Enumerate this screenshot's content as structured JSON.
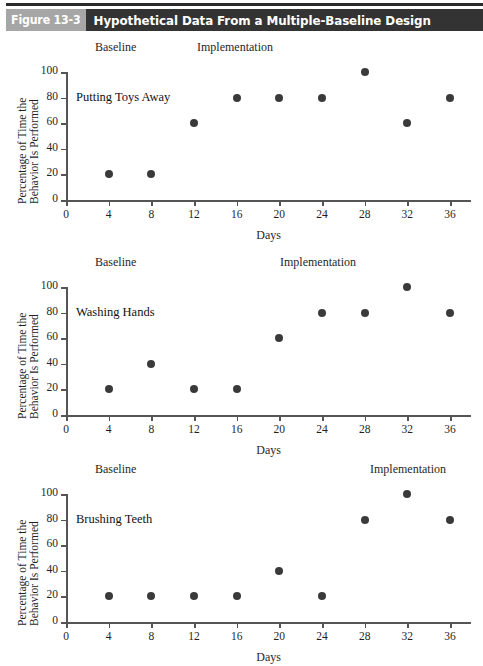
{
  "figure": {
    "number_label": "Figure 13-3",
    "title": "Hypothetical Data From a Multiple-Baseline Design"
  },
  "chart_data": [
    {
      "type": "scatter",
      "title": "Putting Toys Away",
      "xlabel": "Days",
      "ylabel": "Percentage of Time the Behavior Is Performed",
      "ylabel_line1": "Percentage of Time the",
      "ylabel_line2": "Behavior Is Performed",
      "x": [
        4,
        8,
        12,
        16,
        20,
        24,
        28,
        32,
        36
      ],
      "values": [
        20,
        20,
        60,
        80,
        80,
        80,
        100,
        60,
        80
      ],
      "xticks": [
        0,
        4,
        8,
        12,
        16,
        20,
        24,
        28,
        32,
        36
      ],
      "yticks": [
        0,
        20,
        40,
        60,
        80,
        100
      ],
      "xlim": [
        0,
        38
      ],
      "ylim": [
        0,
        100
      ],
      "grid": false,
      "phases": [
        {
          "label": "Baseline",
          "start_day": 0,
          "end_day": 10
        },
        {
          "label": "Implementation",
          "start_day": 10,
          "end_day": 38
        }
      ]
    },
    {
      "type": "scatter",
      "title": "Washing Hands",
      "xlabel": "Days",
      "ylabel": "Percentage of Time the Behavior Is Performed",
      "ylabel_line1": "Percentage of Time the",
      "ylabel_line2": "Behavior Is Performed",
      "x": [
        4,
        8,
        12,
        16,
        20,
        24,
        28,
        32,
        36
      ],
      "values": [
        20,
        40,
        20,
        20,
        60,
        80,
        80,
        100,
        80
      ],
      "xticks": [
        0,
        4,
        8,
        12,
        16,
        20,
        24,
        28,
        32,
        36
      ],
      "yticks": [
        0,
        20,
        40,
        60,
        80,
        100
      ],
      "xlim": [
        0,
        38
      ],
      "ylim": [
        0,
        100
      ],
      "grid": false,
      "phases": [
        {
          "label": "Baseline",
          "start_day": 0,
          "end_day": 18
        },
        {
          "label": "Implementation",
          "start_day": 18,
          "end_day": 38
        }
      ]
    },
    {
      "type": "scatter",
      "title": "Brushing Teeth",
      "xlabel": "Days",
      "ylabel": "Percentage of Time the Behavior Is Performed",
      "ylabel_line1": "Percentage of Time the",
      "ylabel_line2": "Behavior Is Performed",
      "x": [
        4,
        8,
        12,
        16,
        20,
        24,
        28,
        32,
        36
      ],
      "values": [
        20,
        20,
        20,
        20,
        40,
        20,
        80,
        100,
        80
      ],
      "xticks": [
        0,
        4,
        8,
        12,
        16,
        20,
        24,
        28,
        32,
        36
      ],
      "yticks": [
        0,
        20,
        40,
        60,
        80,
        100
      ],
      "xlim": [
        0,
        38
      ],
      "ylim": [
        0,
        100
      ],
      "grid": false,
      "phases": [
        {
          "label": "Baseline",
          "start_day": 0,
          "end_day": 26
        },
        {
          "label": "Implementation",
          "start_day": 26,
          "end_day": 38
        }
      ]
    }
  ],
  "layout": {
    "phase_label_x": [
      {
        "baseline": 95,
        "implementation": 197
      },
      {
        "baseline": 95,
        "implementation": 280
      },
      {
        "baseline": 95,
        "implementation": 370
      }
    ]
  },
  "colors": {
    "marker": "#3a3a3a",
    "axis": "#555555",
    "header_number_bg": "#a6a6a6",
    "header_title_bg": "#333333",
    "header_text": "#ffffff"
  }
}
